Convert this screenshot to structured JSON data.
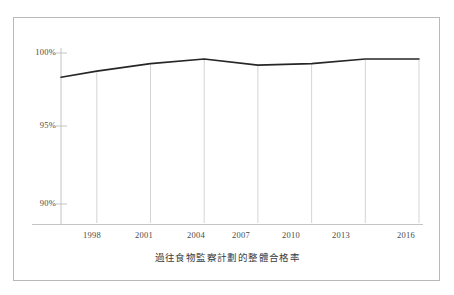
{
  "figure": {
    "caption": "過往食物監察計劃的整體合格率",
    "frame_color": "#b9b9b9",
    "background": "#ffffff"
  },
  "chart_data": {
    "type": "line",
    "title": "",
    "subtitle": "",
    "caption": "過往食物監察計劃的整體合格率",
    "xlabel": "",
    "ylabel": "",
    "x": [
      1996,
      1998,
      2001,
      2004,
      2007,
      2010,
      2013,
      2016
    ],
    "values": [
      98.4,
      98.8,
      99.3,
      99.6,
      99.2,
      99.3,
      99.6,
      99.6
    ],
    "series": [
      {
        "name": "整體合格率",
        "values": [
          98.4,
          98.8,
          99.3,
          99.6,
          99.2,
          99.3,
          99.6,
          99.6
        ],
        "color": "#262626"
      }
    ],
    "xtick_labels": [
      "1998",
      "2001",
      "2004",
      "2007",
      "2010",
      "2013",
      "2016"
    ],
    "xtick_values": [
      1998,
      2001,
      2004,
      2007,
      2010,
      2013,
      2016
    ],
    "ytick_labels": [
      "100%",
      "95%",
      "90%"
    ],
    "ytick_values": [
      100,
      95,
      90
    ],
    "xlim": [
      1996,
      2016
    ],
    "ylim": [
      88.5,
      100.8
    ],
    "grid": "vertical-only",
    "legend": "none",
    "line_color": "#262626",
    "gridline_color": "#c9c9c9",
    "axis_color": "#c0c0c0"
  },
  "axes": {
    "y_tick_100": "100%",
    "y_tick_95": "95%",
    "y_tick_90": "90%",
    "x_tick_1998": "1998",
    "x_tick_2001": "2001",
    "x_tick_2004": "2004",
    "x_tick_2007": "2007",
    "x_tick_2010": "2010",
    "x_tick_2013": "2013",
    "x_tick_2016": "2016"
  }
}
